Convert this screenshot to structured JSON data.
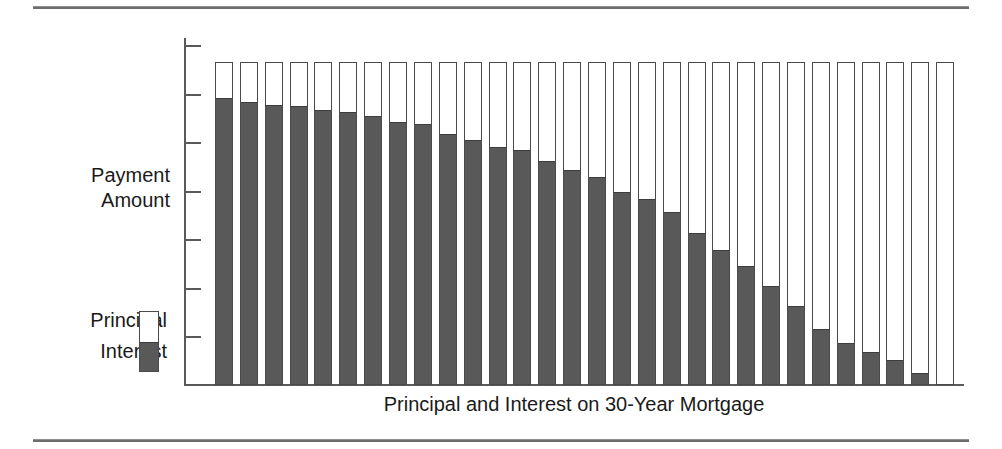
{
  "figure": {
    "top_rule": "horizontal-rule",
    "bottom_rule": "horizontal-rule"
  },
  "axes": {
    "y_label": "Payment\nAmount",
    "x_title": "Principal and Interest on 30-Year Mortgage",
    "y_tick_count": 7,
    "y_tick_labels": [
      "",
      "",
      "",
      "",
      "",
      "",
      ""
    ]
  },
  "legend": {
    "items": [
      {
        "label": "Principal",
        "color": "#ffffff"
      },
      {
        "label": "Interest",
        "color": "#595959"
      }
    ]
  },
  "colors": {
    "interest": "#595959",
    "principal": "#ffffff",
    "outline": "#4a4a4a",
    "axis": "#5a5a5a",
    "rule": "#6d6d6d",
    "text": "#1a1a1a"
  },
  "chart_data": {
    "type": "bar",
    "subtype": "stacked",
    "title": "",
    "xlabel": "Principal and Interest on 30-Year Mortgage",
    "ylabel": "Payment Amount",
    "grid": false,
    "legend_position": "left",
    "ylim": [
      0,
      100
    ],
    "axis_tick_labels_shown": false,
    "categories": [
      "1",
      "2",
      "3",
      "4",
      "5",
      "6",
      "7",
      "8",
      "9",
      "10",
      "11",
      "12",
      "13",
      "14",
      "15",
      "16",
      "17",
      "18",
      "19",
      "20",
      "21",
      "22",
      "23",
      "24",
      "25",
      "26",
      "27",
      "28",
      "29",
      "30"
    ],
    "series": [
      {
        "name": "Interest",
        "color": "#595959",
        "values": [
          88.5,
          87.3,
          86.3,
          86.0,
          84.7,
          84.1,
          83.0,
          81.2,
          80.5,
          77.4,
          75.5,
          73.5,
          72.4,
          69.1,
          66.2,
          64.1,
          59.6,
          57.2,
          53.4,
          46.6,
          41.5,
          36.5,
          30.4,
          24.0,
          17.1,
          12.7,
          9.8,
          7.4,
          3.5,
          0.0
        ]
      },
      {
        "name": "Principal",
        "color": "#ffffff",
        "values": [
          11.5,
          12.7,
          13.7,
          14.0,
          15.3,
          15.9,
          17.0,
          18.8,
          19.5,
          22.6,
          24.5,
          26.5,
          27.6,
          30.9,
          33.8,
          35.9,
          40.4,
          42.8,
          46.6,
          53.4,
          58.5,
          63.5,
          69.6,
          76.0,
          82.9,
          87.3,
          90.2,
          92.6,
          96.5,
          100.0
        ]
      }
    ],
    "total_height_constant": true
  },
  "geometry": {
    "plot_left": 215,
    "plot_right": 961,
    "plot_top": 62,
    "plot_bottom": 385,
    "bar_width": 18,
    "bar_pitch": 24.87
  }
}
